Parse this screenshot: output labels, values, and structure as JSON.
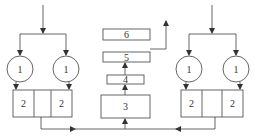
{
  "diagram": {
    "type": "process-flow",
    "colors": {
      "stroke": "#555555",
      "text": "#333333",
      "background": "#ffffff"
    },
    "left_unit": {
      "circles": [
        {
          "label": "1"
        },
        {
          "label": "1"
        }
      ],
      "box_cells": [
        {
          "label": "2"
        },
        {
          "label": ""
        },
        {
          "label": "2"
        }
      ]
    },
    "center_stack": {
      "boxes": [
        {
          "id": "box-6",
          "label": "6"
        },
        {
          "id": "box-5",
          "label": "5"
        },
        {
          "id": "box-4",
          "label": "4"
        },
        {
          "id": "box-3",
          "label": "3"
        }
      ]
    },
    "right_unit": {
      "circles": [
        {
          "label": "1"
        },
        {
          "label": "1"
        }
      ],
      "box_cells": [
        {
          "label": "2"
        },
        {
          "label": ""
        },
        {
          "label": "2"
        }
      ]
    }
  }
}
